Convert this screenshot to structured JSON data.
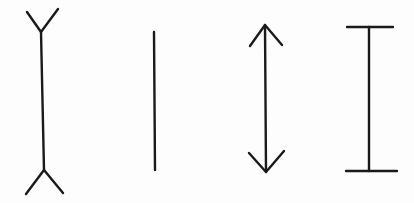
{
  "background": "#fdfdfd",
  "stroke_color": "#1a1a1a",
  "figures": [
    {
      "name": "fins-out-line",
      "shape": "vertical line with outward-pointing fins (Y ends)"
    },
    {
      "name": "plain-line",
      "shape": "plain vertical line"
    },
    {
      "name": "double-arrow-line",
      "shape": "vertical line with inward-pointing arrowheads"
    },
    {
      "name": "i-beam-line",
      "shape": "vertical line with horizontal end caps"
    }
  ]
}
